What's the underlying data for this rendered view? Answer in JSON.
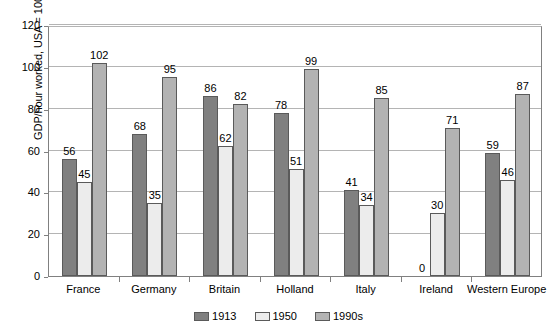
{
  "chart_data": {
    "type": "bar",
    "title": "",
    "subtitle": "",
    "xlabel": "",
    "ylabel": "GDP/hour worked, USA = 100",
    "ylim": [
      0,
      120
    ],
    "yticks": [
      0,
      20,
      40,
      60,
      80,
      100,
      120
    ],
    "grid": true,
    "legend_position": "bottom",
    "categories": [
      "France",
      "Germany",
      "Britain",
      "Holland",
      "Italy",
      "Ireland",
      "Western Europe"
    ],
    "series": [
      {
        "name": "1913",
        "color": "#808080",
        "values": [
          56,
          68,
          86,
          78,
          41,
          0,
          59
        ]
      },
      {
        "name": "1950",
        "color": "#ececec",
        "values": [
          45,
          35,
          62,
          51,
          34,
          30,
          46
        ]
      },
      {
        "name": "1990s",
        "color": "#b3b3b3",
        "values": [
          102,
          95,
          82,
          99,
          85,
          71,
          87
        ]
      }
    ],
    "value_labels": [
      [
        "56",
        "68",
        "86",
        "78",
        "41",
        "0",
        "59"
      ],
      [
        "45",
        "35",
        "62",
        "51",
        "34",
        "30",
        "46"
      ],
      [
        "102",
        "95",
        "82",
        "99",
        "85",
        "71",
        "87"
      ]
    ]
  },
  "legend": {
    "items": [
      {
        "label": "1913"
      },
      {
        "label": "1950"
      },
      {
        "label": "1990s"
      }
    ]
  }
}
